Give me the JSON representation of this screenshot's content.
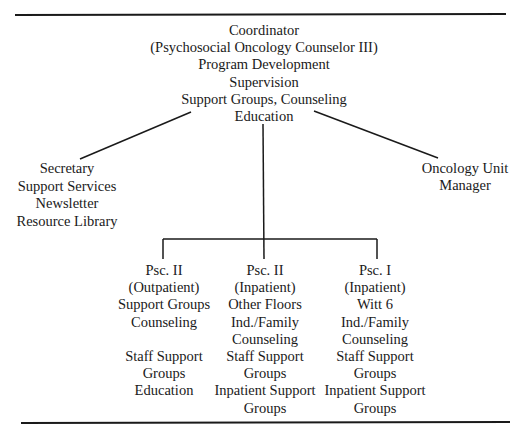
{
  "diagram": {
    "type": "org-chart",
    "colors": {
      "line": "#1a1a1a",
      "text": "#1a1a1a",
      "background": "#ffffff"
    },
    "root": {
      "id": "coordinator",
      "lines": [
        "Coordinator",
        "(Psychosocial Oncology Counselor III)",
        "Program Development",
        "Supervision",
        "Support Groups, Counseling",
        "Education"
      ]
    },
    "side_nodes": [
      {
        "id": "secretary",
        "lines": [
          "Secretary",
          "Support Services",
          "Newsletter",
          "Resource Library"
        ]
      },
      {
        "id": "oncology-unit-manager",
        "lines": [
          "Oncology Unit",
          "Manager"
        ]
      }
    ],
    "children": [
      {
        "id": "psc-ii-outpatient",
        "lines": [
          "Psc. II",
          "(Outpatient)",
          "Support Groups",
          "Counseling",
          "",
          "Staff Support",
          "Groups",
          "Education"
        ]
      },
      {
        "id": "psc-ii-inpatient",
        "lines": [
          "Psc. II",
          "(Inpatient)",
          "Other Floors",
          "Ind./Family",
          "Counseling",
          "Staff Support",
          "Groups",
          "Inpatient Support",
          "Groups"
        ]
      },
      {
        "id": "psc-i-inpatient",
        "lines": [
          "Psc. I",
          "(Inpatient)",
          "Witt 6",
          "Ind./Family",
          "Counseling",
          "Staff Support",
          "Groups",
          "Inpatient Support",
          "Groups"
        ]
      }
    ],
    "edges": [
      {
        "from": "coordinator",
        "to": "secretary",
        "style": "diagonal"
      },
      {
        "from": "coordinator",
        "to": "oncology-unit-manager",
        "style": "diagonal"
      },
      {
        "from": "coordinator",
        "to": "psc-ii-outpatient",
        "style": "elbow"
      },
      {
        "from": "coordinator",
        "to": "psc-ii-inpatient",
        "style": "elbow"
      },
      {
        "from": "coordinator",
        "to": "psc-i-inpatient",
        "style": "elbow"
      }
    ]
  }
}
